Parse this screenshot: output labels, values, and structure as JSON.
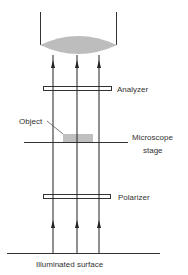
{
  "diagram": {
    "labels": {
      "analyzer": "Analyzer",
      "object": "Object",
      "stage_line1": "Microscope",
      "stage_line2": "stage",
      "polarizer": "Polarizer",
      "surface": "Illuminated surface"
    },
    "rays": {
      "count": 3,
      "x_positions": [
        53,
        77,
        99
      ],
      "direction": "up"
    },
    "colors": {
      "line": "#222222",
      "lens_fill": "#bdbdbd",
      "object_fill": "#bfbfbf",
      "text": "#333333",
      "background": "#ffffff"
    }
  }
}
